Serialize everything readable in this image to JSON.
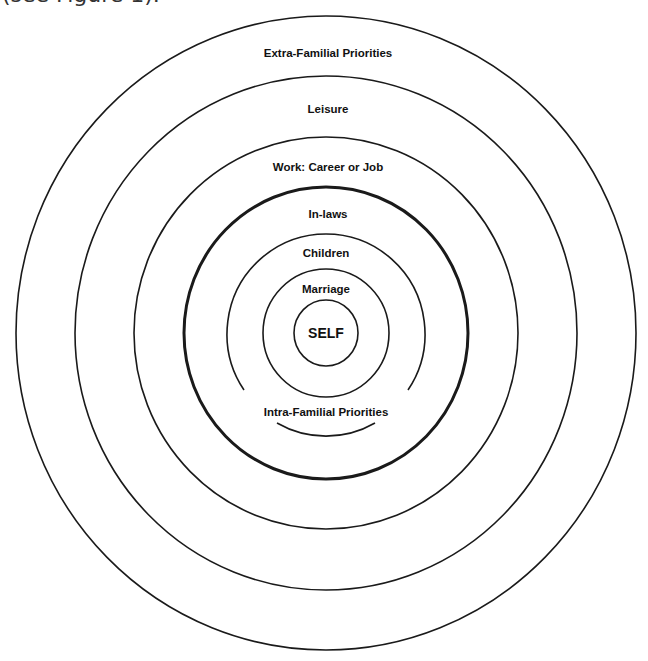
{
  "caption_fragment": "(see Figure 1).",
  "diagram": {
    "center": {
      "x": 326,
      "y": 333
    },
    "rings": [
      {
        "name": "outer",
        "rx": 310,
        "ry": 317,
        "thick": false
      },
      {
        "name": "leisure",
        "rx": 251,
        "ry": 257,
        "thick": false
      },
      {
        "name": "work",
        "rx": 192,
        "ry": 196,
        "thick": false
      },
      {
        "name": "intra-familial-boundary",
        "rx": 142,
        "ry": 146,
        "thick": true
      },
      {
        "name": "children",
        "rx": 99,
        "ry": 100,
        "thick": false,
        "gap_for_label": true
      },
      {
        "name": "marriage",
        "rx": 63,
        "ry": 64,
        "thick": false
      },
      {
        "name": "self",
        "rx": 32,
        "ry": 33,
        "thick": false
      }
    ],
    "labels": {
      "extra_familial": "Extra-Familial Priorities",
      "leisure": "Leisure",
      "work": "Work: Career or Job",
      "in_laws": "In-laws",
      "children": "Children",
      "marriage": "Marriage",
      "self": "SELF",
      "intra_familial": "Intra-Familial Priorities"
    }
  }
}
